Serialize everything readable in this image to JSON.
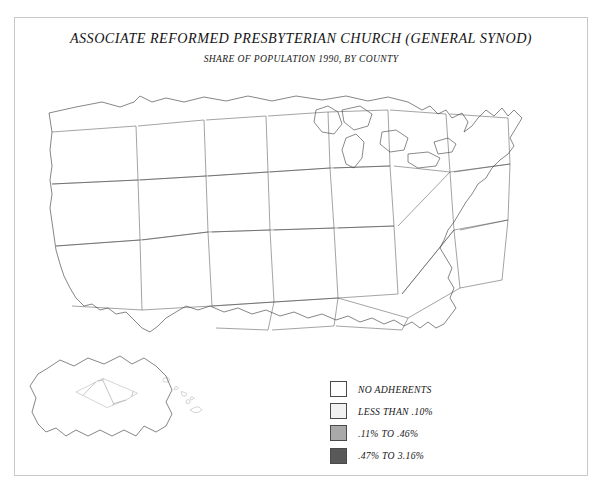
{
  "document": {
    "title": "ASSOCIATE REFORMED PRESBYTERIAN CHURCH (GENERAL SYNOD)",
    "subtitle": "SHARE OF POPULATION 1990, BY COUNTY"
  },
  "chart_data": {
    "type": "heatmap",
    "title": "ASSOCIATE REFORMED PRESBYTERIAN CHURCH (GENERAL SYNOD)",
    "subtitle": "SHARE OF POPULATION 1990, BY COUNTY",
    "xlabel": "",
    "ylabel": "",
    "grid": false,
    "legend_position": "bottom-center-right",
    "units": "percent of county population",
    "year": 1990,
    "geography": "United States counties, including Alaska and Hawaii insets",
    "categories": [
      "NO ADHERENTS",
      "LESS THAN .10%",
      ".11% TO .46%",
      ".47% TO 3.16%"
    ],
    "colors": [
      "#ffffff",
      "#f1f1f1",
      "#a9a9a9",
      "#595959"
    ],
    "bins": [
      {
        "label": "NO ADHERENTS",
        "color": "#ffffff",
        "min": 0,
        "max": 0
      },
      {
        "label": "LESS THAN .10%",
        "color": "#f1f1f1",
        "min": 0.001,
        "max": 0.1
      },
      {
        "label": ".11% TO .46%",
        "color": "#a9a9a9",
        "min": 0.11,
        "max": 0.46
      },
      {
        "label": ".47% TO 3.16%",
        "color": "#595959",
        "min": 0.47,
        "max": 3.16
      }
    ],
    "concentration_regions": [
      {
        "name": "Upstate South Carolina",
        "bin": ".47% TO 3.16%"
      },
      {
        "name": "Western North Carolina",
        "bin": ".47% TO 3.16%"
      },
      {
        "name": "North Georgia",
        "bin": ".11% TO .46%"
      },
      {
        "name": "Central West Florida",
        "bin": ".47% TO 3.16%"
      },
      {
        "name": "Eastern Tennessee",
        "bin": ".11% TO .46%"
      },
      {
        "name": "Scattered Texas and Arkansas counties",
        "bin": ".11% TO .46%"
      }
    ]
  },
  "legend": {
    "items": [
      {
        "label": "NO ADHERENTS",
        "swatch": "sw0"
      },
      {
        "label": "LESS THAN .10%",
        "swatch": "sw1"
      },
      {
        "label": ".11% TO .46%",
        "swatch": "sw2"
      },
      {
        "label": ".47% TO 3.16%",
        "swatch": "sw3"
      }
    ]
  }
}
